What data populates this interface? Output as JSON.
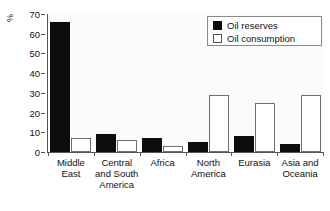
{
  "chart_data": {
    "type": "bar",
    "title": "",
    "xlabel": "",
    "ylabel": "%",
    "ylim": [
      0,
      70
    ],
    "yticks": [
      0,
      10,
      20,
      30,
      40,
      50,
      60,
      70
    ],
    "grid": false,
    "legend_position": "top-right",
    "categories": [
      "Middle East",
      "Central and South America",
      "Africa",
      "North America",
      "Eurasia",
      "Asia and Oceania"
    ],
    "category_lines": [
      [
        "Middle",
        "East"
      ],
      [
        "Central",
        "and South",
        "America"
      ],
      [
        "Africa"
      ],
      [
        "North",
        "America"
      ],
      [
        "Eurasia"
      ],
      [
        "Asia and",
        "Oceania"
      ]
    ],
    "series": [
      {
        "name": "Oil reserves",
        "color": "#0d0d0d",
        "values": [
          66,
          9,
          7,
          5,
          8,
          4
        ]
      },
      {
        "name": "Oil consumption",
        "color": "#ffffff",
        "values": [
          7,
          6,
          3,
          29,
          25,
          29
        ]
      }
    ]
  },
  "legend": {
    "items": [
      {
        "label": "Oil reserves",
        "swatch": "reserves"
      },
      {
        "label": "Oil consumption",
        "swatch": "consumption"
      }
    ]
  }
}
